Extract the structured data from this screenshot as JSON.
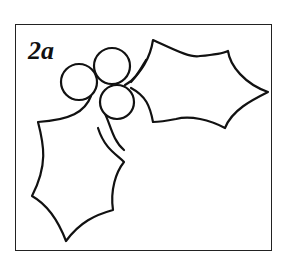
{
  "figure": {
    "label": "2a",
    "stroke_color": "#111111",
    "background_color": "#ffffff"
  }
}
